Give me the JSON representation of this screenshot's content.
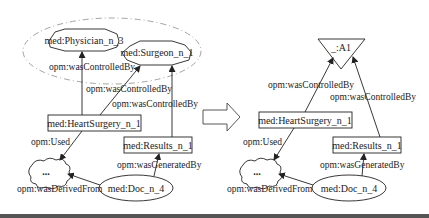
{
  "left_graph": {
    "group_outline": "dashed-ellipse",
    "nodes": {
      "physician": "med:Physician_n_3",
      "surgeon": "med:Surgeon_n_1",
      "heart_surgery": "med:HeartSurgery_n_1",
      "results": "med:Results_n_1",
      "doc": "med:Doc_n_4",
      "cloud": "..."
    },
    "edges": {
      "hs_physician": "opm:wasControlledBy",
      "hs_surgeon": "opm:wasControlledBy",
      "results_surgeon": "opm:wasControlledBy",
      "hs_used": "opm:Used",
      "doc_results": "opm:wasGeneratedBy",
      "doc_cloud": "opm:wasDerivedFrom"
    }
  },
  "transform_arrow": "right-arrow",
  "right_graph": {
    "nodes": {
      "agent": "_:A1",
      "heart_surgery": "med:HeartSurgery_n_1",
      "results": "med:Results_n_1",
      "doc": "med:Doc_n_4",
      "cloud": "..."
    },
    "edges": {
      "hs_agent": "opm:wasControlledBy",
      "results_agent": "opm:wasControlledBy",
      "hs_used": "opm:Used",
      "doc_results": "opm:wasGeneratedBy",
      "doc_cloud": "opm:wasDerivedFrom"
    }
  }
}
